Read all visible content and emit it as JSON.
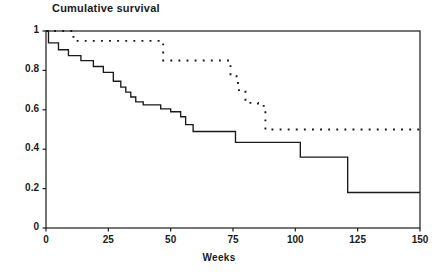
{
  "chart_data": {
    "type": "line",
    "title": "Cumulative survival",
    "xlabel": "Weeks",
    "ylabel": "",
    "xlim": [
      0,
      150
    ],
    "ylim": [
      0,
      1
    ],
    "grid": false,
    "legend": "none",
    "xticks": [
      0,
      25,
      50,
      75,
      100,
      125,
      150
    ],
    "xtick_labels": [
      "0",
      "25",
      "50",
      "75",
      "100",
      "125",
      "150"
    ],
    "yticks": [
      0,
      0.2,
      0.4,
      0.6,
      0.8,
      1
    ],
    "ytick_labels": [
      "0",
      "0.2",
      "0.4",
      "0.6",
      "0.8",
      "1"
    ],
    "series": [
      {
        "name": "solid-curve",
        "style": "solid",
        "color": "#1a1a1a",
        "step": "post",
        "points": [
          [
            0,
            1.0
          ],
          [
            1,
            0.94
          ],
          [
            4,
            0.94
          ],
          [
            5,
            0.905
          ],
          [
            8,
            0.905
          ],
          [
            9,
            0.875
          ],
          [
            13,
            0.875
          ],
          [
            14,
            0.85
          ],
          [
            18,
            0.85
          ],
          [
            19,
            0.82
          ],
          [
            22,
            0.82
          ],
          [
            23,
            0.79
          ],
          [
            26,
            0.79
          ],
          [
            27,
            0.745
          ],
          [
            29,
            0.745
          ],
          [
            30,
            0.715
          ],
          [
            31,
            0.715
          ],
          [
            32,
            0.69
          ],
          [
            33,
            0.69
          ],
          [
            34,
            0.665
          ],
          [
            35,
            0.665
          ],
          [
            36,
            0.64
          ],
          [
            38,
            0.64
          ],
          [
            39,
            0.625
          ],
          [
            45,
            0.625
          ],
          [
            46,
            0.605
          ],
          [
            49,
            0.605
          ],
          [
            50,
            0.59
          ],
          [
            53,
            0.59
          ],
          [
            54,
            0.565
          ],
          [
            55,
            0.565
          ],
          [
            56,
            0.525
          ],
          [
            58,
            0.525
          ],
          [
            59,
            0.49
          ],
          [
            75,
            0.49
          ],
          [
            76,
            0.435
          ],
          [
            101,
            0.435
          ],
          [
            102,
            0.36
          ],
          [
            120,
            0.36
          ],
          [
            121,
            0.18
          ],
          [
            150,
            0.18
          ]
        ]
      },
      {
        "name": "dotted-curve",
        "style": "dotted",
        "color": "#1a1a1a",
        "step": "post",
        "points": [
          [
            0,
            1.0
          ],
          [
            10,
            1.0
          ],
          [
            11,
            0.95
          ],
          [
            46,
            0.95
          ],
          [
            47,
            0.85
          ],
          [
            73,
            0.85
          ],
          [
            74,
            0.77
          ],
          [
            76,
            0.77
          ],
          [
            77,
            0.7
          ],
          [
            79,
            0.7
          ],
          [
            80,
            0.635
          ],
          [
            84,
            0.635
          ],
          [
            85,
            0.62
          ],
          [
            87,
            0.62
          ],
          [
            88,
            0.5
          ],
          [
            150,
            0.5
          ]
        ]
      }
    ]
  },
  "plot_geometry": {
    "left": 46,
    "right": 420,
    "top": 31,
    "bottom": 228
  }
}
